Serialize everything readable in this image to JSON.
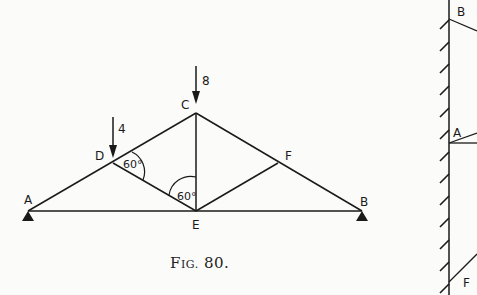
{
  "figure": {
    "caption": "Fig. 80.",
    "caption_prefix": "F",
    "caption_small": "IG.",
    "caption_number": " 80."
  },
  "truss": {
    "nodes": {
      "A": {
        "label": "A",
        "x": 28,
        "y": 211
      },
      "B": {
        "label": "B",
        "x": 362,
        "y": 211
      },
      "C": {
        "label": "C",
        "x": 196,
        "y": 113
      },
      "D": {
        "label": "D",
        "x": 113,
        "y": 163
      },
      "E": {
        "label": "E",
        "x": 196,
        "y": 211
      },
      "F": {
        "label": "F",
        "x": 278,
        "y": 163
      }
    },
    "members": [
      [
        "A",
        "D"
      ],
      [
        "D",
        "C"
      ],
      [
        "C",
        "F"
      ],
      [
        "F",
        "B"
      ],
      [
        "A",
        "E"
      ],
      [
        "E",
        "B"
      ],
      [
        "D",
        "E"
      ],
      [
        "C",
        "E"
      ],
      [
        "E",
        "F"
      ]
    ],
    "loads": [
      {
        "node": "D",
        "value": "4"
      },
      {
        "node": "C",
        "value": "8"
      }
    ],
    "angles": [
      {
        "at": "D",
        "label": "60°"
      },
      {
        "at": "E",
        "label": "60°"
      }
    ],
    "supports": [
      "A",
      "B"
    ]
  },
  "force_diagram": {
    "labels": {
      "B": "B",
      "A": "A",
      "F": "F"
    }
  },
  "colors": {
    "ink": "#1a1a1a",
    "paper": "#fbfbfa"
  }
}
